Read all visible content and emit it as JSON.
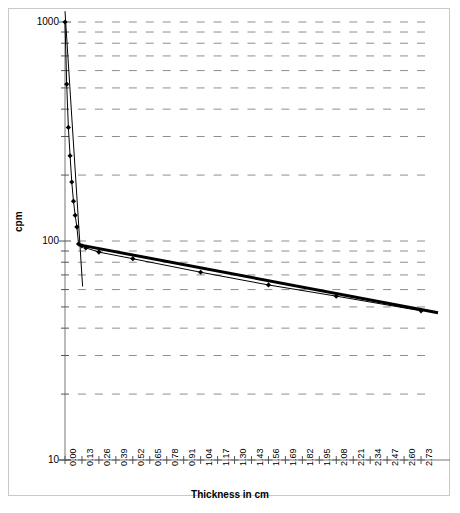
{
  "chart_data": {
    "type": "line",
    "title": "",
    "xlabel": "Thickness in cm",
    "ylabel": "cpm",
    "yscale": "log",
    "xscale": "linear",
    "ylim": [
      10,
      1000
    ],
    "xlim": [
      0.0,
      2.86
    ],
    "grid": true,
    "grid_style": "dashed-minor-ticks",
    "legend": "none",
    "y_tick_labels": [
      "1000",
      "100",
      "10"
    ],
    "y_tick_values": [
      1000,
      100,
      10
    ],
    "x_tick_labels": [
      "0.00",
      "0.13",
      "0.26",
      "0.39",
      "0.52",
      "0.65",
      "0.78",
      "0.91",
      "1.04",
      "1.17",
      "1.30",
      "1.43",
      "1.56",
      "1.69",
      "1.82",
      "1.95",
      "2.08",
      "2.21",
      "2.34",
      "2.47",
      "2.60",
      "2.73"
    ],
    "x_tick_values": [
      0.0,
      0.13,
      0.26,
      0.39,
      0.52,
      0.65,
      0.78,
      0.91,
      1.04,
      1.17,
      1.3,
      1.43,
      1.56,
      1.69,
      1.82,
      1.95,
      2.08,
      2.21,
      2.34,
      2.47,
      2.6,
      2.73
    ],
    "series": [
      {
        "name": "measured counts",
        "marker": "filled-diamond",
        "color": "#000000",
        "points": [
          {
            "x": 0.0,
            "y": 1000
          },
          {
            "x": 0.013,
            "y": 520
          },
          {
            "x": 0.026,
            "y": 330
          },
          {
            "x": 0.039,
            "y": 245
          },
          {
            "x": 0.052,
            "y": 186
          },
          {
            "x": 0.065,
            "y": 152
          },
          {
            "x": 0.078,
            "y": 131
          },
          {
            "x": 0.091,
            "y": 116
          },
          {
            "x": 0.104,
            "y": 97
          },
          {
            "x": 0.13,
            "y": 95
          },
          {
            "x": 0.16,
            "y": 93
          },
          {
            "x": 0.26,
            "y": 89
          },
          {
            "x": 0.52,
            "y": 83
          },
          {
            "x": 1.04,
            "y": 72
          },
          {
            "x": 1.56,
            "y": 63
          },
          {
            "x": 2.08,
            "y": 56
          },
          {
            "x": 2.73,
            "y": 48
          }
        ]
      }
    ],
    "fit_lines": [
      {
        "name": "steep-component-fit",
        "description": "steep fitted straight line through the fast-decaying component",
        "x_start": 0.0,
        "y_start": 1120,
        "x_end": 0.135,
        "y_end": 62,
        "linewidth": 1
      },
      {
        "name": "shallow-component-fit",
        "description": "shallow fitted straight line through the slowly-decaying component",
        "x_start": 0.11,
        "y_start": 96,
        "x_end": 2.86,
        "y_end": 47,
        "linewidth": 3
      }
    ]
  },
  "axes": {
    "ylabel": "cpm",
    "xlabel": "Thickness in cm"
  }
}
